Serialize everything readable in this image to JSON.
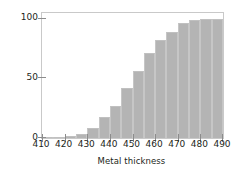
{
  "chart_data": {
    "type": "bar",
    "title": "",
    "xlabel": "Metal thickness",
    "ylabel": "Frequency",
    "xlim": [
      410,
      490
    ],
    "ylim": [
      0,
      105
    ],
    "xticks": [
      410,
      420,
      430,
      440,
      450,
      460,
      470,
      480,
      490
    ],
    "yticks": [
      0,
      50,
      100
    ],
    "grid": false,
    "legend": null,
    "bin_width": 5,
    "bar_color": "#b4b4b4",
    "axis_color": "#c9c9c9",
    "text_color": "#231f20",
    "bin_starts": [
      410,
      415,
      420,
      425,
      430,
      435,
      440,
      445,
      450,
      455,
      460,
      465,
      470,
      475,
      480,
      485
    ],
    "categories": [
      "410-415",
      "415-420",
      "420-425",
      "425-430",
      "430-435",
      "435-440",
      "440-445",
      "445-450",
      "450-455",
      "455-460",
      "460-465",
      "465-470",
      "470-475",
      "475-480",
      "480-485",
      "485-490"
    ],
    "values": [
      0.5,
      1,
      1.5,
      3,
      8,
      18,
      27,
      42,
      56,
      71,
      82,
      89,
      97,
      99,
      100,
      100
    ],
    "note": "cumulative frequency histogram"
  },
  "axes": {
    "ylabel": "Frequency",
    "xlabel": "Metal thickness",
    "xticklabels": [
      "410",
      "420",
      "430",
      "440",
      "450",
      "460",
      "470",
      "480",
      "490"
    ],
    "yticklabels": [
      "0",
      "50",
      "100"
    ]
  }
}
